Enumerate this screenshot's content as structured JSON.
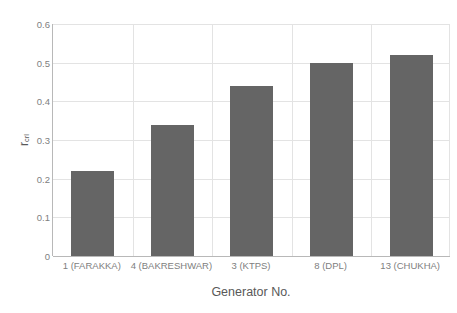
{
  "chart_data": {
    "type": "bar",
    "title": "",
    "categories": [
      "1 (FARAKKA)",
      "4 (BAKRESHWAR)",
      "3 (KTPS)",
      "8 (DPL)",
      "13 (CHUKHA)"
    ],
    "values": [
      0.22,
      0.34,
      0.44,
      0.5,
      0.52
    ],
    "series": [
      {
        "name": "r_crl",
        "values": [
          0.22,
          0.34,
          0.44,
          0.5,
          0.52
        ]
      }
    ],
    "xlabel": "Generator No.",
    "ylabel": "r",
    "ylabel_subscript": "crl",
    "ylim": [
      0,
      0.6
    ],
    "yticks": [
      "0",
      "0.1",
      "0.2",
      "0.3",
      "0.4",
      "0.5",
      "0.6"
    ],
    "ytick_values": [
      0,
      0.1,
      0.2,
      0.3,
      0.4,
      0.5,
      0.6
    ],
    "grid": true,
    "grid_axis": "both",
    "legend": "none",
    "bar_color": "#656565",
    "grid_color": "#e3e3e3",
    "axis_color": "#b8b8b8",
    "text_color": "#808080",
    "title_color": "#595959",
    "background": "#ffffff"
  }
}
